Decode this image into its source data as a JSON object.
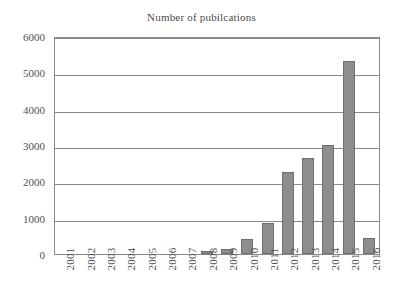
{
  "chart_data": {
    "type": "bar",
    "title": "Number of pubilcations",
    "xlabel": "",
    "ylabel": "",
    "ylim": [
      0,
      6000
    ],
    "yticks": [
      0,
      1000,
      2000,
      3000,
      4000,
      5000,
      6000
    ],
    "ytick_labels": [
      "0",
      "1000",
      "2000",
      "3000",
      "4000",
      "5000",
      "6000"
    ],
    "grid": true,
    "legend": false,
    "bar_color": "#8d8d8d",
    "bar_edge_color": "#6f6f6f",
    "axis_color": "#8a8a8a",
    "categories": [
      "2001",
      "2002",
      "2003",
      "2004",
      "2005",
      "2006",
      "2007",
      "2008",
      "2009",
      "2010",
      "2011",
      "2012",
      "2013",
      "2014",
      "2015",
      "2016"
    ],
    "values": [
      0,
      0,
      0,
      25,
      0,
      0,
      5,
      90,
      150,
      420,
      840,
      2260,
      2640,
      2990,
      5320,
      440
    ]
  }
}
